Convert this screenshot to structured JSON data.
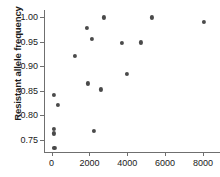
{
  "chart_data": {
    "type": "scatter",
    "title": "",
    "xlabel": "",
    "ylabel": "Resistant allele frequency",
    "xlim": [
      -400,
      8900
    ],
    "ylim": [
      0.725,
      1.015
    ],
    "grid": false,
    "legend": null,
    "marker_color": "#4a4a4a",
    "axis_color": "#6f6f6f",
    "xticks": [
      0,
      2000,
      4000,
      6000,
      8000
    ],
    "xtick_labels": [
      "0",
      "2000",
      "4000",
      "6000",
      "8000"
    ],
    "yticks": [
      0.75,
      0.8,
      0.85,
      0.9,
      0.95,
      1.0
    ],
    "ytick_labels": [
      "0.75",
      "0.80",
      "0.85",
      "0.90",
      "0.95",
      "1.00"
    ],
    "points": [
      {
        "x": 150,
        "y": 0.734
      },
      {
        "x": 130,
        "y": 0.763
      },
      {
        "x": 130,
        "y": 0.772
      },
      {
        "x": 140,
        "y": 0.842
      },
      {
        "x": 330,
        "y": 0.821
      },
      {
        "x": 1250,
        "y": 0.922
      },
      {
        "x": 1880,
        "y": 0.979
      },
      {
        "x": 1900,
        "y": 0.865
      },
      {
        "x": 2150,
        "y": 0.956
      },
      {
        "x": 2230,
        "y": 0.768
      },
      {
        "x": 2600,
        "y": 0.853
      },
      {
        "x": 2750,
        "y": 1.0
      },
      {
        "x": 3700,
        "y": 0.947
      },
      {
        "x": 3980,
        "y": 0.885
      },
      {
        "x": 4700,
        "y": 0.949
      },
      {
        "x": 5300,
        "y": 1.0
      },
      {
        "x": 8030,
        "y": 0.99
      }
    ]
  }
}
